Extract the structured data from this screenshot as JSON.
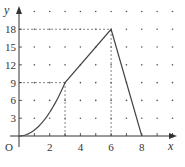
{
  "chart_data": {
    "type": "line",
    "title": "",
    "xlabel": "x",
    "ylabel": "y",
    "origin_label": "O",
    "xlim": [
      0,
      10
    ],
    "ylim": [
      0,
      21
    ],
    "x_ticks": [
      2,
      4,
      6,
      8
    ],
    "x_tick_labels": [
      "2",
      "4",
      "6",
      "8"
    ],
    "y_ticks": [
      3,
      6,
      9,
      12,
      15,
      18
    ],
    "y_tick_labels": [
      "3",
      "6",
      "9",
      "12",
      "15",
      "18"
    ],
    "grid": "dots",
    "series": [
      {
        "name": "f(x)",
        "segments": [
          {
            "kind": "curve",
            "formula": "y = x^2",
            "x": [
              0,
              0.5,
              1,
              1.5,
              2,
              2.5,
              3
            ],
            "y": [
              0,
              0.25,
              1,
              2.25,
              4,
              6.25,
              9
            ]
          },
          {
            "kind": "line",
            "x": [
              3,
              6
            ],
            "y": [
              9,
              18
            ]
          },
          {
            "kind": "line",
            "x": [
              6,
              8
            ],
            "y": [
              18,
              0
            ]
          }
        ]
      }
    ],
    "guide_lines": [
      {
        "from": [
          0,
          9
        ],
        "to": [
          3,
          9
        ],
        "style": "dashed"
      },
      {
        "from": [
          3,
          0
        ],
        "to": [
          3,
          9
        ],
        "style": "dashed"
      },
      {
        "from": [
          0,
          18
        ],
        "to": [
          6,
          18
        ],
        "style": "dashed"
      },
      {
        "from": [
          6,
          0
        ],
        "to": [
          6,
          18
        ],
        "style": "dashed"
      }
    ],
    "legend": "none"
  }
}
